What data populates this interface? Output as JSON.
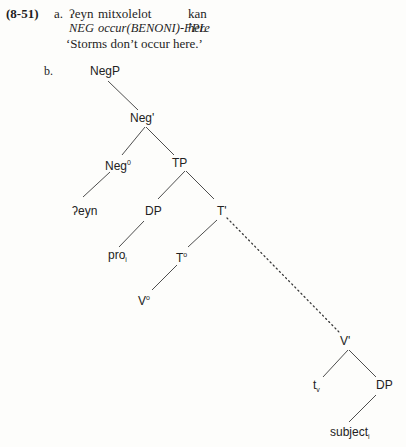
{
  "example": {
    "number": "(8-51)",
    "part_a": {
      "label": "a.",
      "words": [
        "ʔeyn",
        "mitxolelot",
        "kan"
      ],
      "gloss": {
        "neg": "NEG",
        "occur_main": "occur(",
        "occur_benoni": "BENONI",
        "occur_tail": ")-",
        "occur_fpl": "FPL",
        "here": "here"
      },
      "translation": "‘Storms don’t occur here.’"
    },
    "part_b": {
      "label": "b."
    }
  },
  "tree": {
    "nodes": {
      "negp": "NegP",
      "negbar": "Neg'",
      "neg0_base": "Neg",
      "neg0_sup": "0",
      "tp": "TP",
      "eyn": "ʔeyn",
      "dp1": "DP",
      "tbar": "T'",
      "pro_base": "pro",
      "pro_sub": "i",
      "t0_base": "T",
      "t0_sup": "o",
      "v0_base": "V",
      "v0_sup": "o",
      "vbar": "V'",
      "tv_base": "t",
      "tv_sub": "v",
      "dp2": "DP",
      "subject_base": "subject",
      "subject_sub": "i"
    },
    "edges": [
      {
        "from": "NegP",
        "to": "Neg'",
        "style": "solid"
      },
      {
        "from": "Neg'",
        "to": "Neg0",
        "style": "solid"
      },
      {
        "from": "Neg'",
        "to": "TP",
        "style": "solid"
      },
      {
        "from": "Neg0",
        "to": "ʔeyn",
        "style": "solid"
      },
      {
        "from": "TP",
        "to": "DP",
        "style": "solid"
      },
      {
        "from": "TP",
        "to": "T'",
        "style": "solid"
      },
      {
        "from": "DP",
        "to": "pro_i",
        "style": "solid"
      },
      {
        "from": "T'",
        "to": "T0",
        "style": "solid"
      },
      {
        "from": "T0",
        "to": "V0",
        "style": "solid"
      },
      {
        "from": "T'",
        "to": "V'",
        "style": "dotted"
      },
      {
        "from": "V'",
        "to": "t_v",
        "style": "solid"
      },
      {
        "from": "V'",
        "to": "DP",
        "style": "solid"
      },
      {
        "from": "DP",
        "to": "subject_i",
        "style": "solid"
      }
    ]
  }
}
